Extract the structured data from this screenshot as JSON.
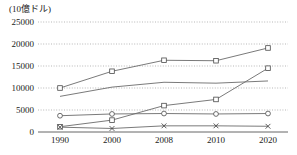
{
  "chart_data": {
    "type": "line",
    "title": "",
    "unit_label": "(10億ドル)",
    "xlabel": "",
    "ylabel": "",
    "categories": [
      "1990",
      "2000",
      "2008",
      "2010",
      "2020"
    ],
    "x_positions": [
      1990,
      2000,
      2008,
      2010,
      2020
    ],
    "ylim": [
      0,
      25000
    ],
    "yticks": [
      0,
      5000,
      10000,
      15000,
      20000,
      25000
    ],
    "ytick_labels": [
      "0",
      "5000",
      "10000",
      "15000",
      "20000",
      "25000"
    ],
    "grid": true,
    "legend_position": "none",
    "series": [
      {
        "name": "series-1",
        "marker": "square",
        "values": [
          10000,
          13800,
          16300,
          16200,
          19100
        ]
      },
      {
        "name": "series-2",
        "marker": "none",
        "values": [
          8100,
          10200,
          11300,
          11100,
          11600
        ]
      },
      {
        "name": "series-3",
        "marker": "square",
        "values": [
          1200,
          2700,
          6000,
          7400,
          14500
        ]
      },
      {
        "name": "series-4",
        "marker": "circle",
        "values": [
          3700,
          4100,
          4200,
          4100,
          4200
        ]
      },
      {
        "name": "series-5",
        "marker": "cross",
        "values": [
          1100,
          800,
          1400,
          1400,
          1300
        ]
      }
    ]
  },
  "plot_geometry": {
    "left": 38,
    "right": 288,
    "top": 22,
    "bottom": 132,
    "x_pixel_positions": [
      60,
      112,
      164,
      216,
      268
    ]
  },
  "colors": {
    "line": "#6b6b6b",
    "grid": "#9a9a9a",
    "axis": "#555555",
    "text": "#222222",
    "marker_fill": "#ffffff",
    "marker_stroke": "#4a4a4a",
    "background": "#ffffff"
  }
}
